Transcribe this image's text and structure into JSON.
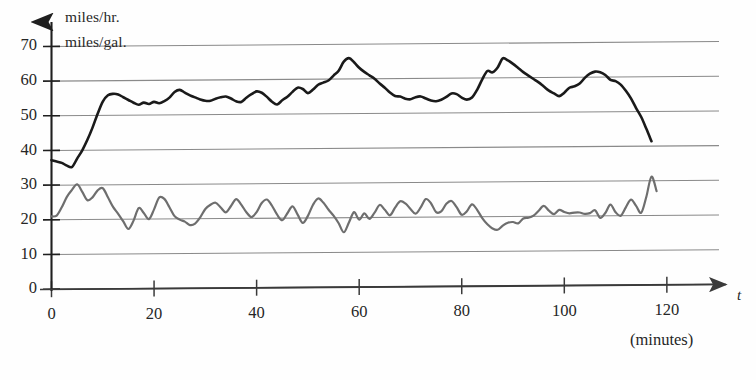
{
  "chart_data": {
    "type": "line",
    "title": "",
    "subtitle": "",
    "ylabel_lines": [
      "miles/hr.",
      "miles/gal."
    ],
    "xlabel": "t",
    "xlabel_units": "(minutes)",
    "grid": true,
    "legend_position": "none",
    "xlim": [
      0,
      130
    ],
    "ylim": [
      0,
      75
    ],
    "xticks": [
      0,
      20,
      40,
      60,
      80,
      100,
      120
    ],
    "yticks": [
      0,
      10,
      20,
      30,
      40,
      50,
      60,
      70
    ],
    "xtick_labels": [
      "0",
      "20",
      "40",
      "60",
      "80",
      "100",
      "120"
    ],
    "ytick_labels": [
      "0",
      "10",
      "20",
      "30",
      "40",
      "50",
      "60",
      "70"
    ],
    "series": [
      {
        "name": "speed",
        "unit": "miles/hr.",
        "color": "#1a1a1a",
        "width": 2.6,
        "x": [
          0,
          1,
          2,
          3,
          4,
          5,
          6,
          7,
          8,
          9,
          10,
          11,
          12,
          13,
          14,
          15,
          16,
          17,
          18,
          19,
          20,
          21,
          22,
          23,
          24,
          25,
          26,
          27,
          28,
          29,
          30,
          31,
          32,
          33,
          34,
          35,
          36,
          37,
          38,
          39,
          40,
          41,
          42,
          43,
          44,
          45,
          46,
          47,
          48,
          49,
          50,
          51,
          52,
          53,
          54,
          55,
          56,
          57,
          58,
          59,
          60,
          61,
          62,
          63,
          64,
          65,
          66,
          67,
          68,
          69,
          70,
          71,
          72,
          73,
          74,
          75,
          76,
          77,
          78,
          79,
          80,
          81,
          82,
          83,
          84,
          85,
          86,
          87,
          88,
          89,
          90,
          91,
          92,
          93,
          94,
          95,
          96,
          97,
          98,
          99,
          100,
          101,
          102,
          103,
          104,
          105,
          106,
          107,
          108,
          109,
          110,
          111,
          112,
          113,
          114,
          115,
          116,
          117
        ],
        "y": [
          37.2,
          36.8,
          36.4,
          35.6,
          35.2,
          37.6,
          40.0,
          43.0,
          46.5,
          50.5,
          54.0,
          55.8,
          56.2,
          56.0,
          55.2,
          54.4,
          53.6,
          53.0,
          53.6,
          53.2,
          53.8,
          53.4,
          54.0,
          55.0,
          56.6,
          57.2,
          56.4,
          55.6,
          55.0,
          54.4,
          54.0,
          54.0,
          54.6,
          55.0,
          55.2,
          54.6,
          53.8,
          53.6,
          54.8,
          55.8,
          56.6,
          56.2,
          55.0,
          53.6,
          52.8,
          54.0,
          55.0,
          56.4,
          57.6,
          57.2,
          56.0,
          57.0,
          58.4,
          59.0,
          59.6,
          61.0,
          62.4,
          65.0,
          66.0,
          64.8,
          63.2,
          62.0,
          61.0,
          60.0,
          58.6,
          57.4,
          56.0,
          55.0,
          54.8,
          54.2,
          54.0,
          54.6,
          54.8,
          54.2,
          53.6,
          53.4,
          53.8,
          54.6,
          55.6,
          55.4,
          54.4,
          53.8,
          54.4,
          56.6,
          59.6,
          62.0,
          61.6,
          63.0,
          65.6,
          65.0,
          64.0,
          62.8,
          61.6,
          60.6,
          59.6,
          58.6,
          57.4,
          56.2,
          55.4,
          54.6,
          55.6,
          57.0,
          57.4,
          58.2,
          59.8,
          61.0,
          61.6,
          61.4,
          60.6,
          59.2,
          58.8,
          57.8,
          56.0,
          53.8,
          51.0,
          48.4,
          45.0,
          41.4
        ]
      },
      {
        "name": "fuel-economy",
        "unit": "miles/gal.",
        "color": "#6e6e6e",
        "width": 2.2,
        "x": [
          0,
          1,
          2,
          3,
          4,
          5,
          6,
          7,
          8,
          9,
          10,
          11,
          12,
          13,
          14,
          15,
          16,
          17,
          18,
          19,
          20,
          21,
          22,
          23,
          24,
          25,
          26,
          27,
          28,
          29,
          30,
          31,
          32,
          33,
          34,
          35,
          36,
          37,
          38,
          39,
          40,
          41,
          42,
          43,
          44,
          45,
          46,
          47,
          48,
          49,
          50,
          51,
          52,
          53,
          54,
          55,
          56,
          57,
          58,
          59,
          60,
          61,
          62,
          63,
          64,
          65,
          66,
          67,
          68,
          69,
          70,
          71,
          72,
          73,
          74,
          75,
          76,
          77,
          78,
          79,
          80,
          81,
          82,
          83,
          84,
          85,
          86,
          87,
          88,
          89,
          90,
          91,
          92,
          93,
          94,
          95,
          96,
          97,
          98,
          99,
          100,
          101,
          102,
          103,
          104,
          105,
          106,
          107,
          108,
          109,
          110,
          111,
          112,
          113,
          114,
          115,
          116,
          117,
          118
        ],
        "y": [
          21.0,
          21.2,
          23.6,
          26.6,
          28.6,
          30.2,
          28.0,
          25.6,
          26.4,
          28.4,
          29.0,
          26.4,
          23.6,
          21.6,
          19.4,
          17.2,
          19.6,
          23.2,
          21.8,
          20.0,
          22.8,
          26.2,
          25.8,
          23.4,
          20.8,
          19.8,
          19.2,
          18.2,
          18.6,
          20.4,
          22.8,
          24.0,
          24.6,
          23.2,
          21.8,
          23.6,
          25.6,
          24.0,
          21.8,
          20.4,
          21.8,
          24.4,
          25.4,
          23.6,
          21.0,
          19.4,
          21.4,
          23.4,
          21.0,
          18.6,
          20.6,
          23.8,
          25.6,
          24.4,
          22.4,
          20.6,
          18.4,
          15.8,
          18.6,
          21.6,
          19.4,
          21.2,
          19.6,
          21.4,
          23.6,
          22.2,
          20.6,
          22.8,
          24.6,
          24.0,
          22.4,
          21.0,
          22.8,
          25.2,
          24.0,
          21.4,
          21.6,
          23.8,
          24.6,
          22.8,
          20.6,
          21.6,
          23.6,
          22.0,
          19.6,
          17.8,
          16.6,
          16.2,
          17.4,
          18.2,
          18.4,
          18.0,
          19.4,
          19.6,
          20.2,
          21.6,
          23.0,
          21.6,
          20.6,
          21.8,
          21.2,
          20.8,
          21.0,
          21.0,
          20.6,
          20.8,
          21.6,
          19.4,
          20.8,
          23.2,
          21.0,
          20.0,
          22.4,
          24.6,
          22.8,
          20.8,
          25.4,
          31.2,
          27.0
        ]
      }
    ]
  },
  "axes": {
    "y_axis_label_top": "miles/hr.",
    "y_axis_label_bottom": "miles/gal.",
    "x_axis_symbol": "t",
    "x_axis_units": "(minutes)"
  }
}
